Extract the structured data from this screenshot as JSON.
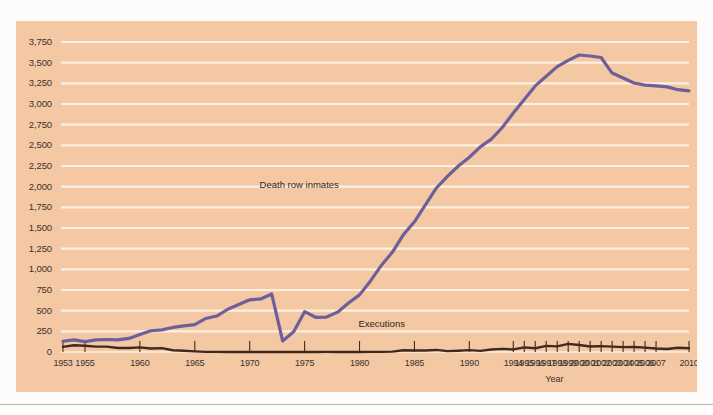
{
  "chart_data": {
    "type": "line",
    "title": "",
    "xlabel": "Year",
    "ylabel": "",
    "grid": true,
    "legend_position": "inline-annotation",
    "xlim": [
      1953,
      2010
    ],
    "ylim": [
      0,
      3875
    ],
    "y_ticks": [
      "0",
      "250",
      "500",
      "750",
      "1,000",
      "1,250",
      "1,500",
      "1,750",
      "2,000",
      "2,250",
      "2,500",
      "2,750",
      "3,000",
      "3,250",
      "3,500",
      "3,750"
    ],
    "y_tick_values": [
      0,
      250,
      500,
      750,
      1000,
      1250,
      1500,
      1750,
      2000,
      2250,
      2500,
      2750,
      3000,
      3250,
      3500,
      3750
    ],
    "x_ticks": [
      "1953",
      "1955",
      "1960",
      "1965",
      "1970",
      "1975",
      "1980",
      "1985",
      "1990",
      "1994",
      "1995",
      "1996",
      "1997",
      "1998",
      "1999",
      "2000",
      "2001",
      "2002",
      "2003",
      "2004",
      "2005",
      "2006",
      "2007",
      "2010"
    ],
    "x_tick_values": [
      1953,
      1955,
      1960,
      1965,
      1970,
      1975,
      1980,
      1985,
      1990,
      1994,
      1995,
      1996,
      1997,
      1998,
      1999,
      2000,
      2001,
      2002,
      2003,
      2004,
      2005,
      2006,
      2007,
      2010
    ],
    "annotations": [
      {
        "text": "Death row inmates",
        "x": 1975,
        "y": 2010
      },
      {
        "text": "Executions",
        "x": 1984,
        "y": 330
      }
    ],
    "colors": {
      "panel_background": "#f3c8a3",
      "gridline": "#fdf0e2",
      "death_row_line": "#6e5f9b",
      "executions_line": "#40291f",
      "text": "#3a3330",
      "page_background": "#fdfcfa"
    },
    "series": [
      {
        "name": "Death row inmates",
        "color": "#6e5f9b",
        "x": [
          1953,
          1954,
          1955,
          1956,
          1957,
          1958,
          1959,
          1960,
          1961,
          1962,
          1963,
          1964,
          1965,
          1966,
          1967,
          1968,
          1969,
          1970,
          1971,
          1972,
          1973,
          1974,
          1975,
          1976,
          1977,
          1978,
          1979,
          1980,
          1981,
          1982,
          1983,
          1984,
          1985,
          1986,
          1987,
          1988,
          1989,
          1990,
          1991,
          1992,
          1993,
          1994,
          1995,
          1996,
          1997,
          1998,
          1999,
          2000,
          2001,
          2002,
          2003,
          2004,
          2005,
          2006,
          2007,
          2008,
          2009,
          2010
        ],
        "values": [
          130,
          147,
          125,
          146,
          151,
          147,
          164,
          212,
          257,
          267,
          297,
          315,
          331,
          406,
          435,
          517,
          575,
          631,
          642,
          702,
          134,
          244,
          488,
          420,
          423,
          482,
          593,
          691,
          860,
          1050,
          1209,
          1420,
          1575,
          1781,
          1984,
          2124,
          2250,
          2356,
          2482,
          2575,
          2716,
          2890,
          3054,
          3219,
          3335,
          3452,
          3527,
          3593,
          3581,
          3562,
          3374,
          3315,
          3254,
          3228,
          3220,
          3207,
          3173,
          3158
        ],
        "peak": {
          "year": 2000,
          "value": 3593
        },
        "end": {
          "year": 2010,
          "value": 3158
        }
      },
      {
        "name": "Executions",
        "color": "#40291f",
        "x": [
          1953,
          1954,
          1955,
          1956,
          1957,
          1958,
          1959,
          1960,
          1961,
          1962,
          1963,
          1964,
          1965,
          1966,
          1967,
          1968,
          1969,
          1970,
          1971,
          1972,
          1973,
          1974,
          1975,
          1976,
          1977,
          1978,
          1979,
          1980,
          1981,
          1982,
          1983,
          1984,
          1985,
          1986,
          1987,
          1988,
          1989,
          1990,
          1991,
          1992,
          1993,
          1994,
          1995,
          1996,
          1997,
          1998,
          1999,
          2000,
          2001,
          2002,
          2003,
          2004,
          2005,
          2006,
          2007,
          2008,
          2009,
          2010
        ],
        "values": [
          62,
          81,
          76,
          65,
          65,
          49,
          49,
          56,
          42,
          47,
          21,
          15,
          7,
          1,
          2,
          0,
          0,
          0,
          0,
          0,
          0,
          0,
          0,
          0,
          1,
          0,
          2,
          0,
          1,
          2,
          5,
          21,
          18,
          18,
          25,
          11,
          16,
          23,
          14,
          31,
          38,
          31,
          56,
          45,
          74,
          68,
          98,
          85,
          66,
          71,
          65,
          59,
          60,
          53,
          42,
          37,
          52,
          46
        ],
        "peak": {
          "year": 1999,
          "value": 98
        }
      }
    ]
  }
}
